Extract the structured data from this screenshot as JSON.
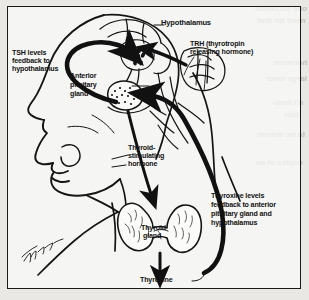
{
  "figure": {
    "background_color": "#e9e8e4",
    "panel_background": "#faf9f7",
    "border_color": "#1a1a1a",
    "ink_color": "#121212",
    "artist_signature": "Thom"
  },
  "labels": {
    "hypothalamus": "Hypothalamus",
    "trh_line1": "TRH (thyrotropin",
    "trh_line2": "releasing hormone)",
    "tsh_feedback_line1": "TSH levels",
    "tsh_feedback_line2": "feedback to",
    "tsh_feedback_line3": "hypothalamus",
    "anterior_pituitary_line1": "Anterior",
    "anterior_pituitary_line2": "pituitary",
    "anterior_pituitary_line3": "gland",
    "tsh_line1": "Thyroid-",
    "tsh_line2": "stimulating",
    "tsh_line3": "hormone",
    "thyroid_gland_line1": "Thyroid",
    "thyroid_gland_line2": "gland",
    "thyroxine": "Thyroxine",
    "thyroxine_feedback_line1": "Thyroxine levels",
    "thyroxine_feedback_line2": "feedback to anterior",
    "thyroxine_feedback_line3": "pituitary gland and",
    "thyroxine_feedback_line4": "hypothalamus"
  },
  "bleed_through": {
    "l1": "one secretion",
    "l2": "need for that",
    "l3": "hormone",
    "l4": "large enter",
    "l5": "n't func-",
    "l6": "tion",
    "l7": "to be determ",
    "l8": "copies of an"
  }
}
